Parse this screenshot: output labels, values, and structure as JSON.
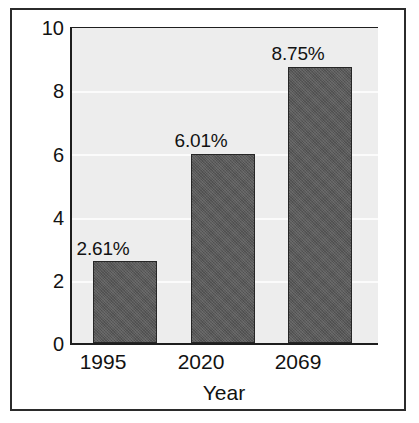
{
  "chart_data": {
    "type": "bar",
    "title": "",
    "subtitle": "",
    "xlabel": "Year",
    "ylabel": "",
    "categories": [
      "1995",
      "2020",
      "2069"
    ],
    "values": [
      2.61,
      6.01,
      8.75
    ],
    "data_labels": [
      "2.61%",
      "6.01%",
      "8.75%"
    ],
    "series": [
      {
        "name": "",
        "values": [
          2.61,
          6.01,
          8.75
        ]
      }
    ],
    "ylim": [
      0,
      10
    ],
    "xlim": null,
    "ytick_labels": [
      "0",
      "2",
      "4",
      "6",
      "8",
      "10"
    ],
    "ytick_values": [
      0,
      2,
      4,
      6,
      8,
      10
    ],
    "grid": "horizontal",
    "legend": "none",
    "annotations": []
  },
  "axes": {
    "x_title": "Year",
    "y_title": "",
    "y_ticks": [
      "0",
      "2",
      "4",
      "6",
      "8",
      "10"
    ],
    "x_ticks": [
      "1995",
      "2020",
      "2069"
    ]
  },
  "labels": {
    "bar1": "2.61%",
    "bar2": "6.01%",
    "bar3": "8.75%"
  },
  "colors": {
    "bar_fill": "#595959",
    "bar_edge": "#262626",
    "plot_background": "#ededed",
    "gridline": "#fbfbfb",
    "axis_line": "#1e1e1e",
    "frame": "#2b2b2b",
    "text": "#121212",
    "figure_background": "#ffffff"
  }
}
